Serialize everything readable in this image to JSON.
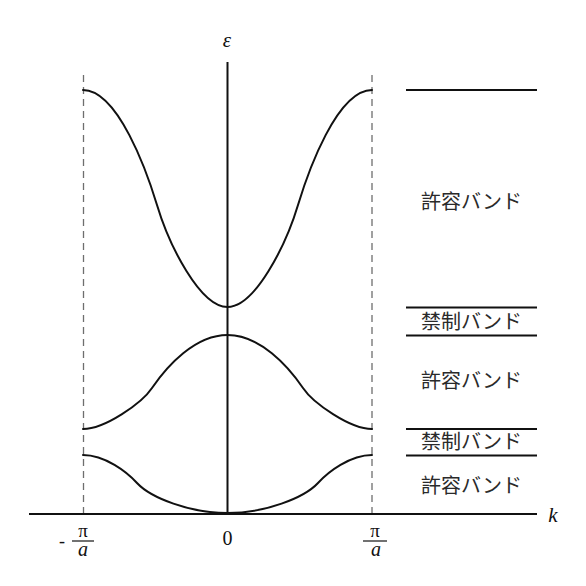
{
  "diagram": {
    "title": "",
    "axes": {
      "y_label": "ε",
      "x_label": "k"
    },
    "x_ticks": {
      "left": {
        "sign": "-",
        "numerator": "π",
        "denominator": "a"
      },
      "center": {
        "label": "0"
      },
      "right": {
        "numerator": "π",
        "denominator": "a"
      }
    },
    "bands": [
      {
        "name": "band-3-upper",
        "shape": "minimum at k=0, maximum at zone boundary",
        "path": "M83,90 C118,90 147,172 157,205 C169,245 200,307 227.5,307 C255,307 286,245 298,205 C308,172 337,90 372,90"
      },
      {
        "name": "band-2-middle",
        "shape": "maximum at k=0, minimum at zone boundary",
        "path": "M83,429 C105,429 142,403 152,388 C167,366 195,335 227.5,335 C260,335 288,366 303,388 C313,403 350,429 372,429"
      },
      {
        "name": "band-1-lower",
        "shape": "minimum at k=0, maximum at zone boundary",
        "path": "M83,455 C105,455 127,472 137,483 C151,498 190,513 227.5,513 C265,513 304,498 318,483 C328,472 350,455 372,455"
      }
    ],
    "energy_regions": [
      {
        "label": "許容バンド",
        "type": "allowed"
      },
      {
        "label": "禁制バンド",
        "type": "forbidden"
      },
      {
        "label": "許容バンド",
        "type": "allowed"
      },
      {
        "label": "禁制バンド",
        "type": "forbidden"
      },
      {
        "label": "許容バンド",
        "type": "allowed"
      }
    ],
    "colors": {
      "line": "#111111",
      "dashed_boundary": "#6e6e6e",
      "label_text": "#2a2a2a",
      "background": "#ffffff"
    }
  }
}
